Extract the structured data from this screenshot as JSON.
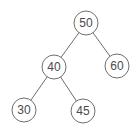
{
  "diagram": {
    "type": "binary-tree",
    "nodes": [
      {
        "id": "n50",
        "label": "50",
        "cx": 86,
        "cy": 23
      },
      {
        "id": "n40",
        "label": "40",
        "cx": 54,
        "cy": 67
      },
      {
        "id": "n60",
        "label": "60",
        "cx": 117,
        "cy": 66
      },
      {
        "id": "n30",
        "label": "30",
        "cx": 24,
        "cy": 110
      },
      {
        "id": "n45",
        "label": "45",
        "cx": 83,
        "cy": 111
      }
    ],
    "edges": [
      {
        "from": "50",
        "to": "40"
      },
      {
        "from": "50",
        "to": "60"
      },
      {
        "from": "40",
        "to": "30"
      },
      {
        "from": "40",
        "to": "45"
      }
    ],
    "colors": {
      "stroke": "#6e6e6e",
      "text": "#4a4a4a",
      "background": "#ffffff"
    }
  }
}
